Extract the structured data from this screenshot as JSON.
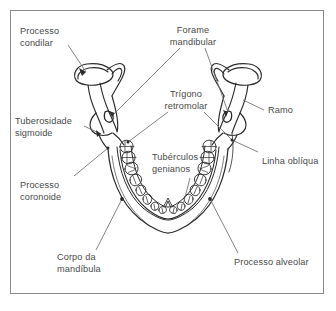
{
  "figure": {
    "language": "pt-BR",
    "frame_color": "#8a8a8a",
    "line_color": "#2b2b2b",
    "label_color": "#4a4a4a",
    "leader_color": "#6e6e6e",
    "background": "#ffffff"
  },
  "labels": {
    "processo_condilar": "Processo\ncondilar",
    "tuberosidade_sigmoide": "Tuberosidade\nsigmoide",
    "processo_coronoide": "Processo\ncoronoide",
    "corpo_da_mandibula": "Corpo da\nmandíbula",
    "forame_mandibular": "Forame\nmandibular",
    "trigono_retromolar": "Trígono\nretromolar",
    "tuberculos_genianos": "Tubérculos\ngenianos",
    "ramo": "Ramo",
    "linha_obliqua": "Linha oblíqua",
    "processo_alveolar": "Processo alveolar"
  },
  "anatomy": {
    "structures": [
      "condyle-left",
      "condyle-right",
      "ramus-left",
      "ramus-right",
      "coronoid-left",
      "coronoid-right",
      "mandibular-foramen-left",
      "mandibular-foramen-right",
      "retromolar-trigone-left",
      "retromolar-trigone-right",
      "alveolar-arch",
      "mandible-body",
      "genial-tubercles",
      "oblique-line-right"
    ],
    "teeth_per_side": 8,
    "tooth_types": [
      "molar",
      "molar",
      "molar",
      "premolar",
      "premolar",
      "canine",
      "incisor",
      "incisor"
    ]
  }
}
